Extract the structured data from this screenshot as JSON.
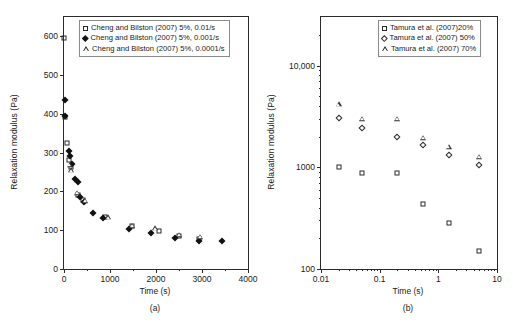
{
  "figure": {
    "panels": [
      {
        "caption": "(a)",
        "xlabel": "Time (s)",
        "ylabel": "Relaxation modulus (Pa)",
        "legend": [
          {
            "marker": "open-square",
            "label": "Cheng and Bilston (2007) 5%, 0.01/s"
          },
          {
            "marker": "filled-diamond",
            "label": "Cheng and Bilston (2007) 5%, 0.001/s"
          },
          {
            "marker": "open-triangle",
            "label": "Cheng and Bilston (2007) 5%, 0.0001/s"
          }
        ]
      },
      {
        "caption": "(b)",
        "xlabel": "Time (s)",
        "ylabel": "Relaxation modulus (Pa)",
        "legend": [
          {
            "marker": "open-square",
            "label": "Tamura et al. (2007)20%"
          },
          {
            "marker": "open-diamond",
            "label": "Tamura et al. (2007) 50%"
          },
          {
            "marker": "open-triangle",
            "label": "Tamura et al. (2007) 70%"
          }
        ]
      }
    ]
  },
  "chart_data": [
    {
      "type": "scatter",
      "title": "(a)",
      "xlabel": "Time (s)",
      "ylabel": "Relaxation modulus (Pa)",
      "xscale": "linear",
      "yscale": "linear",
      "xlim": [
        0,
        4000
      ],
      "ylim": [
        0,
        650
      ],
      "xticks": [
        0,
        1000,
        2000,
        3000,
        4000
      ],
      "xticklabels": [
        "0",
        "1000",
        "2000",
        "3000",
        "4000"
      ],
      "xminorticks": [
        500,
        1500,
        2500,
        3500
      ],
      "yticks": [
        0,
        100,
        200,
        300,
        400,
        500,
        600
      ],
      "yticklabels": [
        "0",
        "100",
        "200",
        "300",
        "400",
        "500",
        "600"
      ],
      "grid": false,
      "legend_position": "top-left",
      "series": [
        {
          "name": "Cheng and Bilston (2007) 5%, 0.01/s",
          "marker": "open-square",
          "points": [
            [
              10,
              595
            ],
            [
              20,
              393
            ],
            [
              60,
              325
            ],
            [
              110,
              280
            ],
            [
              150,
              262
            ],
            [
              300,
              190
            ],
            [
              420,
              178
            ],
            [
              900,
              133
            ],
            [
              1470,
              110
            ],
            [
              2060,
              97
            ],
            [
              2500,
              85
            ],
            [
              2930,
              78
            ]
          ]
        },
        {
          "name": "Cheng and Bilston (2007) 5%, 0.001/s",
          "marker": "filled-diamond",
          "points": [
            [
              15,
              437
            ],
            [
              20,
              395
            ],
            [
              100,
              305
            ],
            [
              140,
              292
            ],
            [
              180,
              272
            ],
            [
              230,
              232
            ],
            [
              300,
              225
            ],
            [
              350,
              185
            ],
            [
              440,
              172
            ],
            [
              620,
              145
            ],
            [
              850,
              131
            ],
            [
              1420,
              104
            ],
            [
              1900,
              92
            ],
            [
              2420,
              81
            ],
            [
              2940,
              73
            ],
            [
              3430,
              71
            ]
          ]
        },
        {
          "name": "Cheng and Bilston (2007) 5%, 0.0001/s",
          "marker": "open-triangle",
          "points": [
            [
              120,
              268
            ],
            [
              160,
              255
            ],
            [
              280,
              197
            ],
            [
              460,
              176
            ],
            [
              960,
              133
            ],
            [
              1480,
              112
            ],
            [
              1980,
              105
            ],
            [
              2500,
              88
            ],
            [
              2960,
              83
            ]
          ]
        }
      ]
    },
    {
      "type": "scatter",
      "title": "(b)",
      "xlabel": "Time (s)",
      "ylabel": "Relaxation modulus (Pa)",
      "xscale": "log",
      "yscale": "log",
      "xlim": [
        0.01,
        10
      ],
      "ylim": [
        100,
        30000
      ],
      "xticks": [
        0.01,
        0.1,
        1,
        10
      ],
      "xticklabels": [
        "0.01",
        "0.1",
        "1",
        "10"
      ],
      "yticks": [
        100,
        1000,
        10000
      ],
      "yticklabels": [
        "100",
        "1000",
        "10,000"
      ],
      "grid": false,
      "legend_position": "top-right",
      "series": [
        {
          "name": "Tamura et al. (2007)20%",
          "marker": "open-square",
          "points": [
            [
              0.02,
              1010
            ],
            [
              0.05,
              880
            ],
            [
              0.2,
              880
            ],
            [
              0.55,
              440
            ],
            [
              1.5,
              285
            ],
            [
              5.0,
              150
            ]
          ]
        },
        {
          "name": "Tamura et al. (2007) 50%",
          "marker": "open-diamond",
          "points": [
            [
              0.02,
              3050
            ],
            [
              0.05,
              2450
            ],
            [
              0.2,
              2000
            ],
            [
              0.55,
              1650
            ],
            [
              1.5,
              1320
            ],
            [
              5.0,
              1060
            ]
          ]
        },
        {
          "name": "Tamura et al. (2007) 70%",
          "marker": "open-triangle",
          "points": [
            [
              0.02,
              4150
            ],
            [
              0.05,
              3000
            ],
            [
              0.2,
              3000
            ],
            [
              0.55,
              1950
            ],
            [
              1.5,
              1600
            ],
            [
              5.0,
              1270
            ]
          ]
        }
      ]
    }
  ]
}
